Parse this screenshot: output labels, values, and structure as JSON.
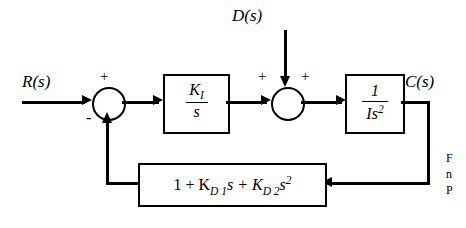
{
  "diagram": {
    "type": "control-system-block-diagram",
    "inputs": [
      {
        "name": "reference-input",
        "label": "R(s)"
      },
      {
        "name": "disturbance-input",
        "label": "D(s)"
      }
    ],
    "outputs": [
      {
        "name": "output-signal",
        "label": "C(s)"
      }
    ],
    "summing_junctions": [
      {
        "name": "error-summer",
        "signs": [
          "+",
          "-"
        ]
      },
      {
        "name": "disturbance-summer",
        "signs": [
          "+",
          "+"
        ]
      }
    ],
    "blocks": [
      {
        "name": "integral-controller-block",
        "numerator": "K",
        "numerator_sub": "I",
        "denominator": "s"
      },
      {
        "name": "plant-block",
        "numerator": "1",
        "denominator": "Is",
        "denominator_sup": "2"
      },
      {
        "name": "feedback-block",
        "label": "1 + K",
        "label_sub1": "D 1",
        "label_mid": "s + K",
        "label_sub2": "D 2",
        "label_end": "s",
        "label_sup": "2"
      }
    ],
    "signs": {
      "plus": "+",
      "minus": "-"
    },
    "margin_text": [
      "F",
      "n",
      "P"
    ]
  }
}
